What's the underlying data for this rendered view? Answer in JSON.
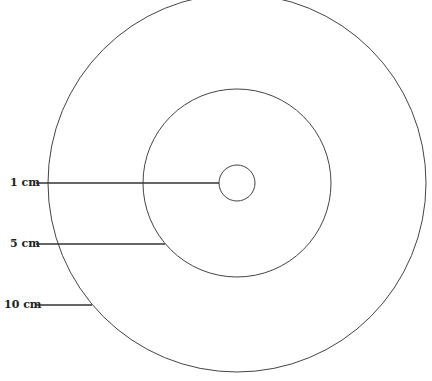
{
  "diagram": {
    "stroke_color": "#444444",
    "center": {
      "x": 237,
      "y": 183
    },
    "circles": [
      {
        "id": "small",
        "r": 18
      },
      {
        "id": "medium",
        "r": 94
      },
      {
        "id": "large",
        "r": 189
      }
    ],
    "labels": [
      {
        "id": "label-1cm",
        "text": "1 cm",
        "x": 10,
        "y": 177,
        "line": {
          "x1": 36,
          "y1": 183,
          "x2": 219,
          "y2": 183
        }
      },
      {
        "id": "label-5cm",
        "text": "5 cm",
        "x": 10,
        "y": 238,
        "line": {
          "x1": 36,
          "y1": 244,
          "x2": 165,
          "y2": 244
        }
      },
      {
        "id": "label-10cm",
        "text": "10 cm",
        "x": 4,
        "y": 299,
        "line": {
          "x1": 36,
          "y1": 305,
          "x2": 92,
          "y2": 305
        }
      }
    ]
  }
}
